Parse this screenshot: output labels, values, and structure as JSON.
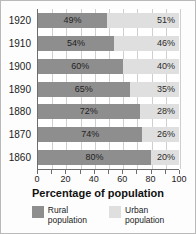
{
  "chart_data": {
    "type": "bar",
    "orientation": "horizontal",
    "stacked": true,
    "title": "",
    "xlabel": "Percentage of population",
    "ylabel": "",
    "xlim": [
      0,
      100
    ],
    "xticks": [
      0,
      20,
      40,
      60,
      80,
      100
    ],
    "xtick_labels": [
      "0",
      "20",
      "40",
      "60",
      "80",
      "100"
    ],
    "minor_tick_step": 10,
    "grid": true,
    "grid_axis": "x",
    "legend_position": "bottom",
    "categories": [
      "1920",
      "1910",
      "1900",
      "1890",
      "1880",
      "1870",
      "1860"
    ],
    "series": [
      {
        "name": "Rural population",
        "color": "#8e8e8e",
        "values": [
          49,
          54,
          60,
          65,
          72,
          74,
          80
        ],
        "value_labels": [
          "49%",
          "54%",
          "60%",
          "65%",
          "72%",
          "74%",
          "80%"
        ]
      },
      {
        "name": "Urban population",
        "color": "#dfdfdf",
        "values": [
          51,
          46,
          40,
          35,
          28,
          26,
          20
        ],
        "value_labels": [
          "51%",
          "46%",
          "40%",
          "35%",
          "28%",
          "26%",
          "20%"
        ]
      }
    ]
  },
  "axis_title": "Percentage of population",
  "legend": {
    "items": [
      {
        "line1": "Rural",
        "line2": "population",
        "color": "#8e8e8e"
      },
      {
        "line1": "Urban",
        "line2": "population",
        "color": "#dfdfdf"
      }
    ]
  }
}
